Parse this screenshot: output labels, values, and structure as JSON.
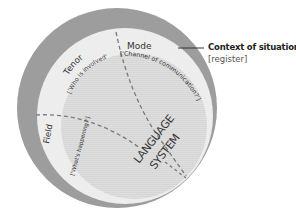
{
  "diagram": {
    "outer_ring": {
      "label": "Context of situation",
      "sublabel": "[register]"
    },
    "segments": [
      {
        "name": "Mode",
        "question": "['Channel of communication?']"
      },
      {
        "name": "Tenor",
        "question": "['Who is involved']"
      },
      {
        "name": "Field",
        "question": "['What's happening?']"
      }
    ],
    "core": {
      "line1": "LANGUAGE",
      "line2": "SYSTEM"
    },
    "colors": {
      "outer": "#9a9a9a",
      "middle": "#ececec",
      "inner": "#dcdcdc",
      "dashes": "#7a7a7a",
      "text": "#333333"
    }
  }
}
